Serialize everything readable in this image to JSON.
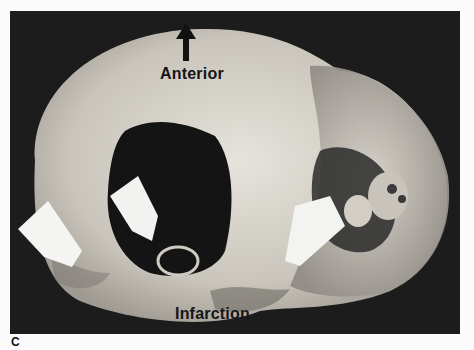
{
  "figure": {
    "panel_label": "C",
    "labels": {
      "top": "Anterior",
      "bottom": "Infarction"
    },
    "icons": [
      "up-arrow-icon",
      "white-pointer-arrow-left",
      "white-pointer-arrow-center",
      "white-pointer-arrow-right"
    ],
    "colors": {
      "background": "#1c1c1c",
      "tissue": "#d8d4cc",
      "page": "#fbfbfb"
    }
  }
}
